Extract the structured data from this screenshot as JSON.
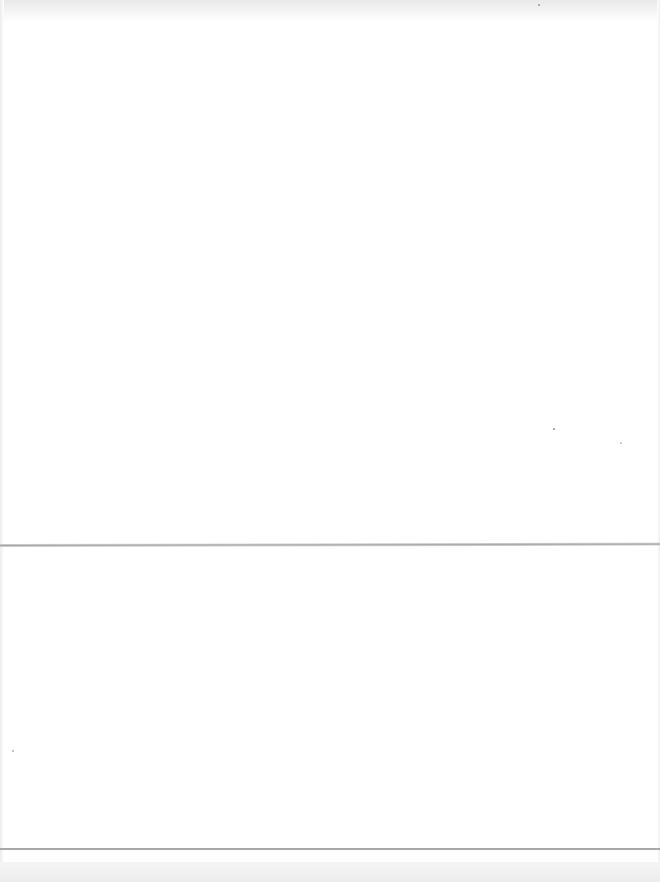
{
  "page": {
    "type": "blank-scanned-page",
    "text": "",
    "background": "#ffffff"
  },
  "marks": {
    "fold_line": {
      "y": 545,
      "color": "#a9a9a9"
    },
    "bottom_rules": [
      {
        "y": 848,
        "color": "#a8a8a8"
      },
      {
        "y": 862,
        "color": "#b5b5b5"
      }
    ],
    "specks": [
      {
        "x": 553,
        "y": 428
      },
      {
        "x": 620,
        "y": 442
      },
      {
        "x": 12,
        "y": 750
      },
      {
        "x": 538,
        "y": 4
      }
    ]
  }
}
